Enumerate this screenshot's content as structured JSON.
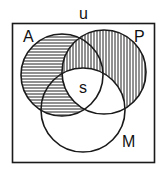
{
  "diagram": {
    "type": "venn",
    "universe_label": "u",
    "sets": [
      {
        "label": "A",
        "cx": 62,
        "cy": 75,
        "r": 41,
        "hatch": "horizontal"
      },
      {
        "label": "P",
        "cx": 104,
        "cy": 72,
        "r": 42,
        "hatch": "vertical"
      },
      {
        "label": "M",
        "cx": 83,
        "cy": 110,
        "r": 42,
        "hatch": "none"
      }
    ],
    "center_label": "s",
    "shading": {
      "horizontal_hatch": "A minus P (excluding central region)",
      "vertical_hatch": "P minus M",
      "unshaded": "A∩P∩M, P∩M only, M only"
    },
    "colors": {
      "stroke": "#1a1a1a",
      "background": "#ffffff"
    }
  }
}
